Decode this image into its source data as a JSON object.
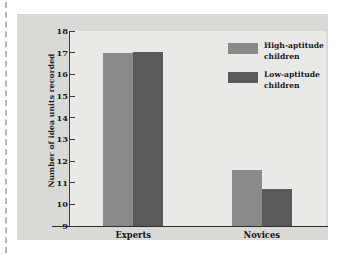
{
  "chart_data": {
    "type": "bar",
    "title": "",
    "xlabel": "",
    "ylabel": "Number of idea units recorded",
    "categories": [
      "Experts",
      "Novices"
    ],
    "series": [
      {
        "name": "High-aptitude children",
        "color": "#8a8a8a",
        "values": [
          17.0,
          11.6
        ]
      },
      {
        "name": "Low-aptitude children",
        "color": "#5a5a5a",
        "values": [
          17.05,
          10.7
        ]
      }
    ],
    "ylim": [
      9,
      18
    ],
    "ytick_labels": [
      "18",
      "17",
      "16",
      "15",
      "14",
      "13",
      "12",
      "11",
      "10",
      "9"
    ],
    "ytick_values": [
      18,
      17,
      16,
      15,
      14,
      13,
      12,
      11,
      10,
      9
    ],
    "grid": false,
    "legend_position": "top-right",
    "annotations": []
  },
  "colors": {
    "page_background": "#ffffff",
    "panel_background": "#d9d9d7",
    "plot_background": "#e9e9e7",
    "axis": "#2e2e2e",
    "text": "#1a1a1a",
    "high_aptitude": "#8a8a8a",
    "low_aptitude": "#5a5a5a"
  },
  "legend": {
    "entries": [
      {
        "label_line1": "High-aptitude",
        "label_line2": "children",
        "color": "#8a8a8a"
      },
      {
        "label_line1": "Low-aptitude",
        "label_line2": "children",
        "color": "#5a5a5a"
      }
    ]
  }
}
